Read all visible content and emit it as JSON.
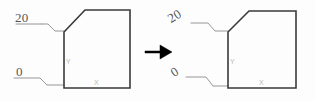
{
  "figure": {
    "title": "",
    "background_color": "#fdfdfd",
    "outline_color": "#3a3a3a",
    "leader_color": "#8a8a8a",
    "label_color": "#555555",
    "axis_label_color": "#b9b9b9",
    "arrow_color": "#000000",
    "panels": [
      {
        "id": "before",
        "name": "left-panel",
        "shape_name": "chamfered-rectangle",
        "labels": {
          "upper_value": "20",
          "lower_value": "0",
          "upper_rotated": false,
          "lower_rotated": false
        },
        "axes": {
          "vertical": "Y",
          "horizontal": "X"
        }
      },
      {
        "id": "after",
        "name": "right-panel",
        "shape_name": "chamfered-rectangle",
        "labels": {
          "upper_value": "20",
          "lower_value": "0",
          "upper_rotated": true,
          "lower_rotated": true
        },
        "axes": {
          "vertical": "Y",
          "horizontal": "X"
        }
      }
    ],
    "transform_arrow": {
      "name": "right-arrow",
      "glyph": "arrow-right-icon",
      "direction": "right"
    }
  }
}
